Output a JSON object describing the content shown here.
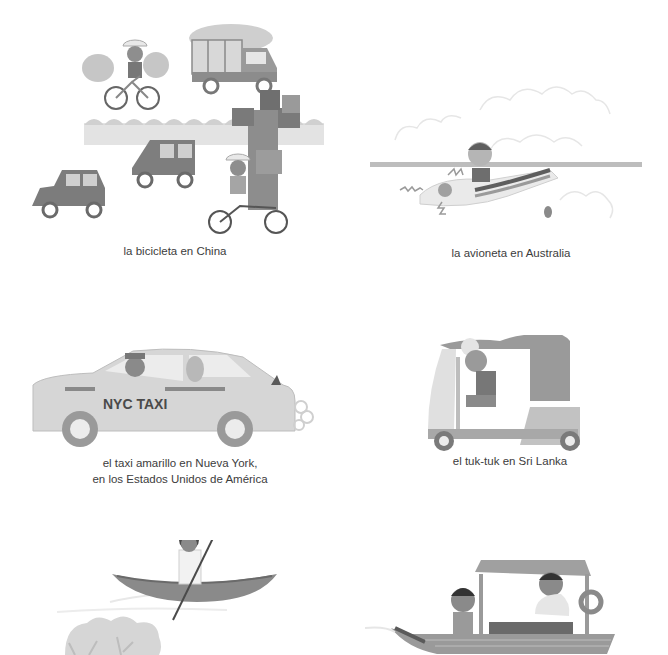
{
  "page": {
    "language": "es",
    "style": "grayscale picture-book illustrations"
  },
  "illustrations": [
    {
      "id": "bicycle-china",
      "caption": "la bicicleta en China",
      "subjects": [
        "cyclist with sacks",
        "loaded truck",
        "two cars",
        "tricycle with stacked boxes",
        "hedge"
      ]
    },
    {
      "id": "plane-australia",
      "caption": "la avioneta en Australia",
      "subjects": [
        "small propeller plane",
        "pilot",
        "clouds"
      ]
    },
    {
      "id": "taxi-new-york",
      "caption_line1": "el taxi amarillo en Nueva York,",
      "caption_line2": "en los Estados Unidos de América",
      "taxi_sign": "NYC TAXI",
      "subjects": [
        "taxi driver",
        "passenger",
        "exhaust smoke"
      ]
    },
    {
      "id": "tuktuk-sri-lanka",
      "caption": "el tuk-tuk en Sri Lanka",
      "subjects": [
        "tuk-tuk",
        "driver"
      ]
    },
    {
      "id": "canoe",
      "subjects": [
        "woman punting canoe",
        "water",
        "bushes"
      ]
    },
    {
      "id": "covered-boat",
      "subjects": [
        "covered boat",
        "boy seated",
        "boatman at wheel",
        "life ring"
      ]
    }
  ],
  "colors": {
    "background": "#ffffff",
    "caption_text": "#3c3c3c",
    "dark_gray": "#6e6e6e",
    "mid_gray": "#8f8f8f",
    "light_gray": "#c8c8c8",
    "pale_gray": "#e4e4e4"
  }
}
